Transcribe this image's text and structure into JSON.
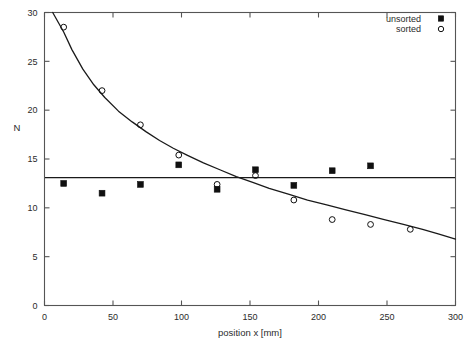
{
  "chart_data": {
    "type": "scatter",
    "title": "",
    "xlabel": "position x [mm]",
    "ylabel": "N",
    "xlim": [
      0,
      300
    ],
    "ylim": [
      0,
      30
    ],
    "xticks": [
      0,
      50,
      100,
      150,
      200,
      250,
      300
    ],
    "yticks": [
      0,
      5,
      10,
      15,
      20,
      25,
      30
    ],
    "xtick_labels": [
      "0",
      "50",
      "100",
      "150",
      "200",
      "250",
      "300"
    ],
    "ytick_labels": [
      "0",
      "5",
      "10",
      "15",
      "20",
      "25",
      "30"
    ],
    "grid": false,
    "legend_position": "top-right",
    "series": [
      {
        "name": "unsorted",
        "marker": "filled-square",
        "color": "#101010",
        "points": [
          {
            "x": 14,
            "y": 12.5
          },
          {
            "x": 42,
            "y": 11.5
          },
          {
            "x": 70,
            "y": 12.4
          },
          {
            "x": 98,
            "y": 14.4
          },
          {
            "x": 126,
            "y": 11.9
          },
          {
            "x": 154,
            "y": 13.9
          },
          {
            "x": 182,
            "y": 12.3
          },
          {
            "x": 210,
            "y": 13.8
          },
          {
            "x": 238,
            "y": 14.3
          }
        ]
      },
      {
        "name": "sorted",
        "marker": "open-circle",
        "color": "#101010",
        "points": [
          {
            "x": 14,
            "y": 28.5
          },
          {
            "x": 42,
            "y": 22.0
          },
          {
            "x": 70,
            "y": 18.5
          },
          {
            "x": 98,
            "y": 15.4
          },
          {
            "x": 126,
            "y": 12.4
          },
          {
            "x": 154,
            "y": 13.3
          },
          {
            "x": 182,
            "y": 10.8
          },
          {
            "x": 210,
            "y": 8.8
          },
          {
            "x": 238,
            "y": 8.3
          },
          {
            "x": 267,
            "y": 7.8
          }
        ]
      }
    ],
    "fits": [
      {
        "name": "constant-fit-unsorted",
        "type": "horizontal-line",
        "value": 13.1
      },
      {
        "name": "decay-fit-sorted",
        "type": "curve",
        "points": [
          {
            "x": 6,
            "y": 30.0
          },
          {
            "x": 10,
            "y": 29.0
          },
          {
            "x": 14,
            "y": 28.0
          },
          {
            "x": 20,
            "y": 26.2
          },
          {
            "x": 28,
            "y": 24.2
          },
          {
            "x": 36,
            "y": 22.6
          },
          {
            "x": 44,
            "y": 21.3
          },
          {
            "x": 54,
            "y": 19.9
          },
          {
            "x": 64,
            "y": 18.8
          },
          {
            "x": 74,
            "y": 17.8
          },
          {
            "x": 84,
            "y": 16.9
          },
          {
            "x": 94,
            "y": 16.1
          },
          {
            "x": 104,
            "y": 15.4
          },
          {
            "x": 116,
            "y": 14.6
          },
          {
            "x": 128,
            "y": 13.9
          },
          {
            "x": 140,
            "y": 13.2
          },
          {
            "x": 152,
            "y": 12.6
          },
          {
            "x": 164,
            "y": 12.0
          },
          {
            "x": 178,
            "y": 11.4
          },
          {
            "x": 192,
            "y": 10.8
          },
          {
            "x": 206,
            "y": 10.3
          },
          {
            "x": 220,
            "y": 9.8
          },
          {
            "x": 234,
            "y": 9.3
          },
          {
            "x": 248,
            "y": 8.8
          },
          {
            "x": 262,
            "y": 8.3
          },
          {
            "x": 276,
            "y": 7.8
          },
          {
            "x": 288,
            "y": 7.3
          },
          {
            "x": 300,
            "y": 6.8
          }
        ]
      }
    ]
  },
  "legend": {
    "items": [
      {
        "label": "unsorted",
        "marker": "filled-square"
      },
      {
        "label": "sorted",
        "marker": "open-circle"
      }
    ]
  },
  "colors": {
    "axis": "#555555",
    "data": "#101010",
    "fit_line": "#1a1a1a",
    "background": "#ffffff"
  }
}
